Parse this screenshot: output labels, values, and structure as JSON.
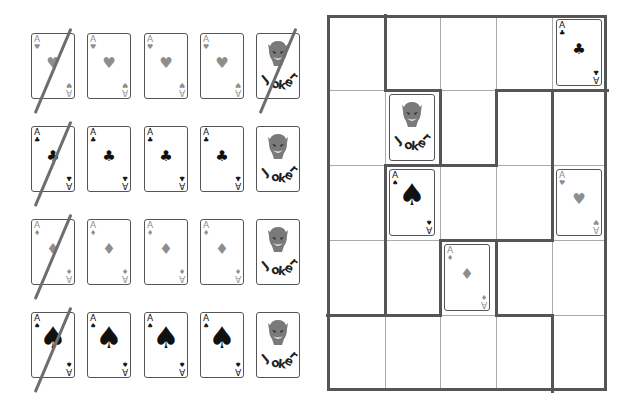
{
  "colors": {
    "red_suit": "#8e8e8e",
    "black_suit": "#111111",
    "card_border": "#555555",
    "slash": "#6e6e6e",
    "grid_thin": "#aaaaaa",
    "grid_thick": "#555555"
  },
  "reference_panel": {
    "rows": [
      {
        "suit": "hearts",
        "cards": [
          {
            "rank": "A",
            "suit_glyph": "♥",
            "crossed": true
          },
          {
            "rank": "A",
            "suit_glyph": "♥",
            "crossed": false
          },
          {
            "rank": "A",
            "suit_glyph": "♥",
            "crossed": false
          },
          {
            "rank": "A",
            "suit_glyph": "♥",
            "crossed": false
          },
          {
            "joker": true,
            "label": "Joker",
            "crossed": true
          }
        ]
      },
      {
        "suit": "clubs",
        "cards": [
          {
            "rank": "A",
            "suit_glyph": "♣",
            "crossed": true
          },
          {
            "rank": "A",
            "suit_glyph": "♣",
            "crossed": false
          },
          {
            "rank": "A",
            "suit_glyph": "♣",
            "crossed": false
          },
          {
            "rank": "A",
            "suit_glyph": "♣",
            "crossed": false
          },
          {
            "joker": true,
            "label": "Joker",
            "crossed": false
          }
        ]
      },
      {
        "suit": "diamonds",
        "cards": [
          {
            "rank": "A",
            "suit_glyph": "♦",
            "crossed": true
          },
          {
            "rank": "A",
            "suit_glyph": "♦",
            "crossed": false
          },
          {
            "rank": "A",
            "suit_glyph": "♦",
            "crossed": false
          },
          {
            "rank": "A",
            "suit_glyph": "♦",
            "crossed": false
          },
          {
            "joker": true,
            "label": "Joker",
            "crossed": false
          }
        ]
      },
      {
        "suit": "spades",
        "cards": [
          {
            "rank": "A",
            "suit_glyph": "♠",
            "crossed": true
          },
          {
            "rank": "A",
            "suit_glyph": "♠",
            "crossed": false
          },
          {
            "rank": "A",
            "suit_glyph": "♠",
            "crossed": false
          },
          {
            "rank": "A",
            "suit_glyph": "♠",
            "crossed": false
          },
          {
            "joker": true,
            "label": "Joker",
            "crossed": false
          }
        ]
      }
    ]
  },
  "puzzle_grid": {
    "columns": 5,
    "rows": 5,
    "placed_cards": [
      {
        "row": 1,
        "col": 5,
        "rank": "A",
        "suit": "clubs",
        "suit_glyph": "♣"
      },
      {
        "row": 2,
        "col": 2,
        "joker": true,
        "label": "Joker"
      },
      {
        "row": 3,
        "col": 2,
        "rank": "A",
        "suit": "spades",
        "suit_glyph": "♠"
      },
      {
        "row": 3,
        "col": 5,
        "rank": "A",
        "suit": "hearts",
        "suit_glyph": "♥"
      },
      {
        "row": 4,
        "col": 3,
        "rank": "A",
        "suit": "diamonds",
        "suit_glyph": "♦"
      }
    ]
  }
}
